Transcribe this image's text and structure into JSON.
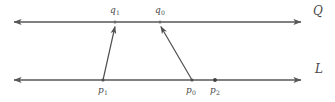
{
  "figure": {
    "type": "geometry-diagram",
    "colors": {
      "line": "#575757",
      "arrow": "#4f4f4f",
      "label": "#4a4a4a",
      "background": "#ffffff"
    },
    "lines": [
      {
        "id": "line-Q",
        "label": "Q",
        "label_base": "Q",
        "label_sub": "",
        "y": 22,
        "x_start": 10,
        "x_end": 305,
        "arrowheads": "both",
        "label_x": 313,
        "label_y": 6
      },
      {
        "id": "line-L",
        "label": "L",
        "label_base": "L",
        "label_sub": "",
        "y": 80,
        "x_start": 10,
        "x_end": 305,
        "arrowheads": "both",
        "label_x": 314,
        "label_y": 64
      }
    ],
    "points": [
      {
        "id": "point-q1",
        "label": "q1",
        "base": "q",
        "sub": "1",
        "x": 115,
        "y": 22,
        "on_line": "line-Q",
        "label_x": 110,
        "label_y": 6
      },
      {
        "id": "point-q0",
        "label": "q0",
        "base": "q",
        "sub": "0",
        "x": 160,
        "y": 22,
        "on_line": "line-Q",
        "label_x": 155,
        "label_y": 6
      },
      {
        "id": "point-p1",
        "label": "p1",
        "base": "p",
        "sub": "1",
        "x": 103,
        "y": 80,
        "on_line": "line-L",
        "label_x": 98,
        "label_y": 86
      },
      {
        "id": "point-p0",
        "label": "p0",
        "base": "p",
        "sub": "0",
        "x": 192,
        "y": 80,
        "on_line": "line-L",
        "label_x": 186,
        "label_y": 86
      },
      {
        "id": "point-p2",
        "label": "p2",
        "base": "p",
        "sub": "2",
        "x": 215,
        "y": 80,
        "on_line": "line-L",
        "label_x": 210,
        "label_y": 86
      }
    ],
    "mapping_arrows": [
      {
        "id": "arrow-p1-to-q1",
        "from_point": "point-p1",
        "to_point": "point-q1",
        "x1": 103,
        "y1": 80,
        "x2": 115,
        "y2": 25
      },
      {
        "id": "arrow-p0-to-q0",
        "from_point": "point-p0",
        "to_point": "point-q0",
        "x1": 192,
        "y1": 80,
        "x2": 160,
        "y2": 25
      }
    ]
  }
}
